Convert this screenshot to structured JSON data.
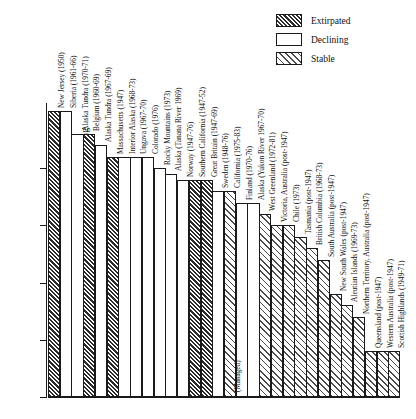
{
  "chart_data": {
    "type": "bar",
    "title": "",
    "xlabel": "",
    "ylabel": "Percent thinning",
    "ylim": [
      0,
      25
    ],
    "yticks": [
      0,
      5,
      10,
      15,
      20
    ],
    "ytick_labels": [
      "0",
      "5",
      "10",
      "15",
      "20"
    ],
    "grid": false,
    "legend_position": "top-right",
    "annotation": "(Managed)",
    "legend": [
      {
        "label": "Extirpated",
        "pattern": "dense-dark-hatch"
      },
      {
        "label": "Declining",
        "pattern": "white-empty"
      },
      {
        "label": "Stable",
        "pattern": "light-hatch"
      }
    ],
    "categories": [
      "New Jersey (1950)",
      "Siberia (1961-66)",
      "Alaska Tundra (1970-71)",
      "Belgium (1960-69)",
      "Alaska Tundra (1967-69)",
      "Massachusetts (1947)",
      "Interior Alaska (1968-73)",
      "Ungava (1967-70)",
      "Colorado (1976)",
      "Rocky Mountains (1973)",
      "Alaska (Tanana River 1969)",
      "Norway (1947-76)",
      "Southern California (1947-52)",
      "Great Britain (1947-69)",
      "Sweden (1948-76)",
      "California (1975-83)",
      "Finland (1970-76)",
      "Alaska (Yukon River 1967-70)",
      "West Greenland (1972-81)",
      "Victoria, Australia (post-1947)",
      "Chile (1973)",
      "Tasmania (post-1947)",
      "British Columbia (1968-73)",
      "South Australia (post-1947)",
      "New South Wales (post-1947)",
      "Aleutian Islands (1969-73)",
      "Northern Territory, Australia (post-1947)",
      "Queensland (post-1947)",
      "Western Australia (post-1947)",
      "Scottish Highlands (1949-71)"
    ],
    "values": [
      25,
      25,
      23,
      23,
      22,
      21,
      21,
      21,
      21,
      20,
      19.5,
      19,
      19,
      19,
      18,
      18,
      17,
      17,
      16,
      15,
      15,
      14,
      13,
      12,
      9,
      8,
      7,
      4,
      4,
      4
    ],
    "series": [
      {
        "name": "status",
        "values": [
          "Extirpated",
          "Declining",
          "Declining",
          "Extirpated",
          "Declining",
          "Extirpated",
          "Declining",
          "Declining",
          "Declining",
          "Declining",
          "Declining",
          "Declining",
          "Extirpated",
          "Extirpated",
          "Declining",
          "Stable",
          "Declining",
          "Declining",
          "Stable",
          "Stable",
          "Stable",
          "Stable",
          "Stable",
          "Stable",
          "Stable",
          "Stable",
          "Stable",
          "Stable",
          "Stable",
          "Stable"
        ]
      }
    ]
  }
}
